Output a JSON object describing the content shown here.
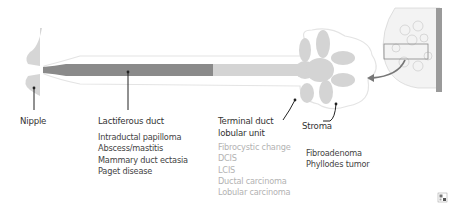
{
  "diagram": {
    "colors": {
      "duct_dark": "#8a8a8a",
      "duct_light": "#d4d4d4",
      "outline": "#e4e4e4",
      "text_dark": "#333333",
      "text_light": "#b3b3b3",
      "arrow": "#777777"
    },
    "labels": {
      "nipple": "Nipple",
      "lactiferous_duct": "Lactiferous duct",
      "tdlu_line1": "Terminal duct",
      "tdlu_line2": "lobular unit",
      "stroma": "Stroma"
    },
    "lactiferous_duct_conditions": [
      "Intraductal papilloma",
      "Abscess/mastitis",
      "Mammary duct ectasia",
      "Paget disease"
    ],
    "tdlu_conditions": [
      "Fibrocystic change",
      "DCIS",
      "LCIS",
      "Ductal carcinoma",
      "Lobular carcinoma"
    ],
    "stroma_conditions": [
      "Fibroadenoma",
      "Phyllodes tumor"
    ],
    "inset": {
      "label": "breast-cross-section-inset"
    },
    "corner_icon": "qr-icon"
  }
}
